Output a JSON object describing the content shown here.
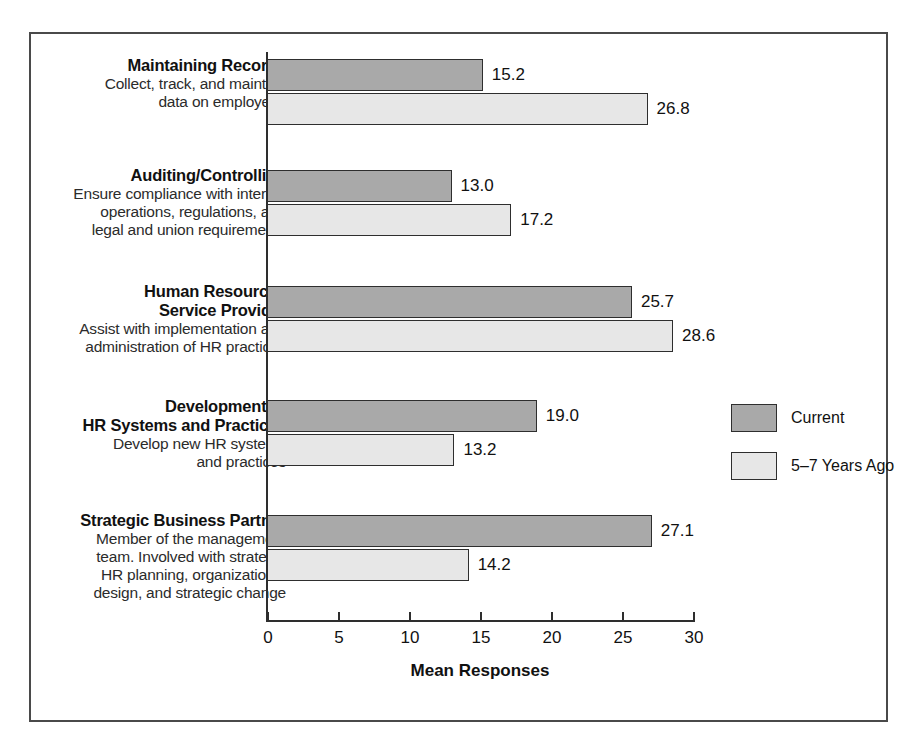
{
  "chart_data": {
    "type": "bar",
    "orientation": "horizontal",
    "title": "",
    "xlabel": "Mean Responses",
    "ylabel": "",
    "xlim": [
      0,
      30
    ],
    "xticks": [
      0,
      5,
      10,
      15,
      20,
      25,
      30
    ],
    "xtick_labels": [
      "0",
      "5",
      "10",
      "15",
      "20",
      "25",
      "30"
    ],
    "grid": false,
    "legend_position": "right",
    "categories": [
      "Maintaining Records",
      "Auditing/Controlling",
      "Human Resources Service Provider",
      "Development of HR Systems and Practices",
      "Strategic Business Partner"
    ],
    "series": [
      {
        "name": "Current",
        "color": "#a9a9a9",
        "values": [
          15.2,
          13.0,
          25.7,
          19.0,
          27.1
        ]
      },
      {
        "name": "5–7 Years Ago",
        "color": "#e7e7e7",
        "values": [
          26.8,
          17.2,
          28.6,
          13.2,
          14.2
        ]
      }
    ],
    "value_labels": [
      [
        "15.2",
        "26.8"
      ],
      [
        "13.0",
        "17.2"
      ],
      [
        "25.7",
        "28.6"
      ],
      [
        "19.0",
        "13.2"
      ],
      [
        "27.1",
        "14.2"
      ]
    ]
  },
  "categories": [
    {
      "title_lines": [
        "Maintaining Records"
      ],
      "desc_lines": [
        "Collect, track, and maintain",
        "data on employees"
      ],
      "current": 15.2,
      "past": 26.8,
      "current_label": "15.2",
      "past_label": "26.8"
    },
    {
      "title_lines": [
        "Auditing/Controlling"
      ],
      "desc_lines": [
        "Ensure compliance with internal",
        "operations, regulations, and",
        "legal and union requirements"
      ],
      "current": 13.0,
      "past": 17.2,
      "current_label": "13.0",
      "past_label": "17.2"
    },
    {
      "title_lines": [
        "Human Resources",
        "Service Provider"
      ],
      "desc_lines": [
        "Assist with implementation and",
        "administration of HR practices"
      ],
      "current": 25.7,
      "past": 28.6,
      "current_label": "25.7",
      "past_label": "28.6"
    },
    {
      "title_lines": [
        "Development of",
        "HR Systems and Practices"
      ],
      "desc_lines": [
        "Develop new HR systems",
        "and practices"
      ],
      "current": 19.0,
      "past": 13.2,
      "current_label": "19.0",
      "past_label": "13.2"
    },
    {
      "title_lines": [
        "Strategic Business Partner"
      ],
      "desc_lines": [
        "Member of the management",
        "team. Involved with strategic",
        "HR planning, organizational",
        "design, and strategic change"
      ],
      "current": 27.1,
      "past": 14.2,
      "current_label": "27.1",
      "past_label": "14.2"
    }
  ],
  "axis": {
    "title": "Mean Responses",
    "ticks": [
      "0",
      "5",
      "10",
      "15",
      "20",
      "25",
      "30"
    ]
  },
  "legend": {
    "items": [
      {
        "label": "Current",
        "color": "#a9a9a9"
      },
      {
        "label": "5–7 Years Ago",
        "color": "#e7e7e7"
      }
    ]
  },
  "colors": {
    "current_bar": "#a9a9a9",
    "past_bar": "#e7e7e7",
    "bar_outline": "#2e2e2e",
    "frame": "#4a4a4a",
    "text": "#111111"
  }
}
